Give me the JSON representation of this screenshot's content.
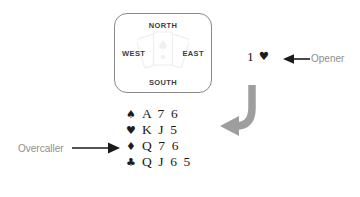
{
  "diagram": {
    "compass": {
      "north": "NORTH",
      "south": "SOUTH",
      "west": "WEST",
      "east": "EAST",
      "watermark_icon": "playing-cards-fan-icon"
    },
    "bid": {
      "level": "1",
      "suit_symbol": "♥",
      "suit_name": "hearts",
      "full_text": "1 ♥"
    },
    "annotations": {
      "opener": "Opener",
      "overcaller": "Overcaller"
    },
    "hand": {
      "rows": [
        {
          "suit_symbol": "♠",
          "suit_name": "spades",
          "cards": "A 7 6"
        },
        {
          "suit_symbol": "♥",
          "suit_name": "hearts",
          "cards": "K J 5"
        },
        {
          "suit_symbol": "♦",
          "suit_name": "diamonds",
          "cards": "Q 7 6"
        },
        {
          "suit_symbol": "♣",
          "suit_name": "clubs",
          "cards": "Q J 6 5"
        }
      ]
    },
    "colors": {
      "box_border": "#8a8a8a",
      "text_dark": "#181818",
      "label_gray": "#8e8e8e",
      "curved_arrow": "#9a9a9a",
      "thin_arrow": "#1a1a1a",
      "background": "#ffffff"
    }
  }
}
